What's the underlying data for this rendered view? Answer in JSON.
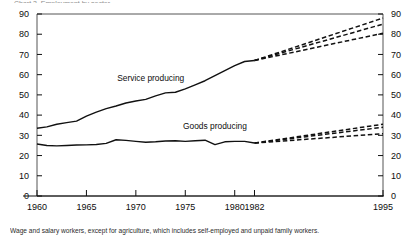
{
  "figure": {
    "top_partial_text": "Chart 3. Employment by sector",
    "footnote": "Wage and salary workers, except for agriculture, which includes self-employed and unpaid family workers."
  },
  "chart_data": {
    "type": "line",
    "title": "",
    "xlabel": "",
    "ylabel": "",
    "xlim": [
      1960,
      1995
    ],
    "ylim": [
      0,
      90
    ],
    "grid": false,
    "legend": "inline-annotations",
    "x_ticks": [
      1960,
      1965,
      1970,
      1975,
      1980,
      1982,
      1995
    ],
    "x_tick_labels": [
      "1960",
      "1965",
      "1970",
      "1975",
      "1980",
      "1982",
      "1995"
    ],
    "y_ticks": [
      0,
      10,
      20,
      30,
      40,
      50,
      60,
      70,
      80,
      90
    ],
    "y_tick_labels": [
      "0",
      "10",
      "20",
      "30",
      "40",
      "50",
      "60",
      "70",
      "80",
      "90"
    ],
    "y_ticks_right": [
      0,
      10,
      20,
      30,
      40,
      50,
      60,
      70,
      80,
      90
    ],
    "y_tick_labels_right": [
      "0",
      "10",
      "20",
      "30",
      "40",
      "50",
      "60",
      "70",
      "80",
      "90"
    ],
    "annotations": [
      {
        "text": "Service producing",
        "x": 1971.5,
        "y": 57
      },
      {
        "text": "Goods producing",
        "x": 1978.0,
        "y": 33
      }
    ],
    "series": [
      {
        "name": "Service producing",
        "style": "solid",
        "x": [
          1960,
          1961,
          1962,
          1963,
          1964,
          1965,
          1966,
          1967,
          1968,
          1969,
          1970,
          1971,
          1972,
          1973,
          1974,
          1975,
          1976,
          1977,
          1978,
          1979,
          1980,
          1981,
          1982
        ],
        "values": [
          33.5,
          34.2,
          35.5,
          36.3,
          37.0,
          39.5,
          41.5,
          43.2,
          44.5,
          46.0,
          47.0,
          47.8,
          49.5,
          51.0,
          51.3,
          53.0,
          55.0,
          57.0,
          59.5,
          62.0,
          64.5,
          66.5,
          67.0
        ]
      },
      {
        "name": "Goods producing",
        "style": "solid",
        "x": [
          1960,
          1961,
          1962,
          1963,
          1964,
          1965,
          1966,
          1967,
          1968,
          1969,
          1970,
          1971,
          1972,
          1973,
          1974,
          1975,
          1976,
          1977,
          1978,
          1979,
          1980,
          1981,
          1982
        ],
        "values": [
          25.7,
          25.0,
          24.8,
          25.0,
          25.2,
          25.3,
          25.5,
          26.0,
          27.8,
          27.5,
          27.0,
          26.6,
          26.8,
          27.2,
          27.3,
          27.0,
          27.3,
          27.6,
          25.4,
          26.8,
          27.0,
          27.0,
          26.2
        ]
      },
      {
        "name": "Service producing projection high",
        "style": "dashed",
        "x": [
          1982,
          1995
        ],
        "values": [
          67.0,
          88.0
        ]
      },
      {
        "name": "Service producing projection moderate",
        "style": "dashed",
        "x": [
          1982,
          1995
        ],
        "values": [
          67.0,
          85.0
        ]
      },
      {
        "name": "Service producing projection low",
        "style": "dashed",
        "x": [
          1982,
          1995
        ],
        "values": [
          67.0,
          80.5
        ]
      },
      {
        "name": "Goods producing projection high",
        "style": "dashed",
        "x": [
          1982,
          1995
        ],
        "values": [
          26.2,
          35.5
        ]
      },
      {
        "name": "Goods producing projection moderate",
        "style": "dashed",
        "x": [
          1982,
          1995
        ],
        "values": [
          26.2,
          34.0
        ]
      },
      {
        "name": "Goods producing projection low",
        "style": "dashed",
        "x": [
          1982,
          1995
        ],
        "values": [
          26.2,
          30.8
        ]
      }
    ],
    "colors": {
      "line": "#111111",
      "axis": "#555555",
      "text": "#0d0d0d",
      "background": "#ffffff"
    }
  }
}
